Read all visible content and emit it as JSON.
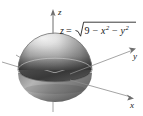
{
  "figure": {
    "background_color": "#ffffff",
    "equation": {
      "lhs": "z",
      "equals": "=",
      "radicand_lead": "9",
      "minus_1": "−",
      "var_x": "x",
      "exp_x": "2",
      "minus_2": "−",
      "var_y": "y",
      "exp_y": "2",
      "plain": "z = √(9 − x² − y²)"
    },
    "axes": [
      {
        "name": "z-axis",
        "label": "z",
        "direction": "up"
      },
      {
        "name": "y-axis",
        "label": "y",
        "direction": "right-up"
      },
      {
        "name": "x-axis",
        "label": "x",
        "direction": "right-down"
      }
    ],
    "surface": {
      "kind": "hemisphere",
      "radius": 3,
      "shading": "grayscale-gradient",
      "highlight_color": "#f2f2f2",
      "mid_color": "#9a9a9a",
      "shadow_color": "#3d3d3d",
      "rim_color": "#5a5a5a"
    },
    "colors": {
      "axis_line": "#8d8d8d",
      "text": "#171717"
    }
  }
}
